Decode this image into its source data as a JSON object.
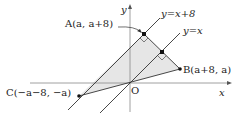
{
  "diagram": {
    "colors": {
      "fill": "#e6e6e6",
      "stroke": "#333333",
      "axis": "#888888"
    },
    "axes": {
      "x_label": "x",
      "y_label": "y",
      "origin_label": "O"
    },
    "lines": [
      {
        "label": "y=x+8"
      },
      {
        "label": "y=x"
      }
    ],
    "points": [
      {
        "name": "A",
        "label": "A(a, a+8)"
      },
      {
        "name": "B",
        "label": "B(a+8, a)"
      },
      {
        "name": "C",
        "label": "C(−a−8, −a)"
      }
    ]
  }
}
